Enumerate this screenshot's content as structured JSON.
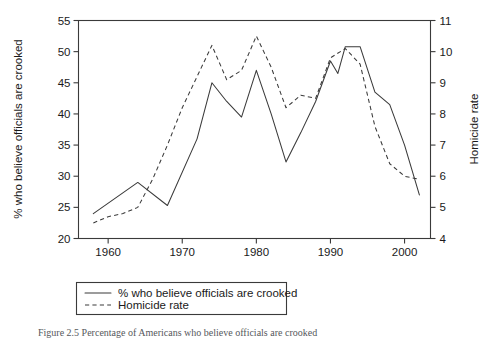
{
  "figure": {
    "caption": "Figure 2.5  Percentage of Americans who believe officials are crooked"
  },
  "chart_data": {
    "type": "line",
    "title": "",
    "xlabel": "",
    "ylabel": "% who believe officials are crooked",
    "y2label": "Homicide rate",
    "grid": false,
    "legend_position": "bottom-left",
    "xlim": [
      1956.0,
      2003.5
    ],
    "ylim": [
      20,
      55
    ],
    "y2lim": [
      4,
      11
    ],
    "xticks": [
      1960,
      1970,
      1980,
      1990,
      2000
    ],
    "xticklabels": [
      "1960",
      "1970",
      "1980",
      "1990",
      "2000"
    ],
    "yticks": [
      20,
      25,
      30,
      35,
      40,
      45,
      50,
      55
    ],
    "yticklabels": [
      "20",
      "25",
      "30",
      "35",
      "40",
      "45",
      "50",
      "55"
    ],
    "y2ticks": [
      4,
      5,
      6,
      7,
      8,
      9,
      10,
      11
    ],
    "y2ticklabels": [
      "4",
      "5",
      "6",
      "7",
      "8",
      "9",
      "10",
      "11"
    ],
    "series": [
      {
        "name": "% who believe officials are crooked",
        "style": "solid",
        "axis": "left",
        "x": [
          1958,
          1964,
          1968,
          1972,
          1974,
          1976,
          1978,
          1980,
          1982,
          1984,
          1986,
          1988,
          1990,
          1991,
          1992,
          1994,
          1996,
          1998,
          2000,
          2002
        ],
        "values": [
          24.0,
          29.0,
          25.3,
          36.0,
          45.0,
          42.0,
          39.5,
          47.0,
          40.0,
          32.3,
          37.0,
          42.0,
          48.5,
          46.5,
          50.8,
          50.8,
          43.5,
          41.5,
          35.0,
          27.0
        ]
      },
      {
        "name": "Homicide rate",
        "style": "dashed",
        "axis": "right",
        "x": [
          1958,
          1960,
          1962,
          1964,
          1966,
          1968,
          1970,
          1972,
          1974,
          1976,
          1978,
          1980,
          1982,
          1984,
          1986,
          1988,
          1990,
          1992,
          1994,
          1996,
          1998,
          2000,
          2002
        ],
        "values": [
          4.5,
          4.7,
          4.8,
          5.0,
          5.9,
          7.0,
          8.2,
          9.2,
          10.2,
          9.1,
          9.4,
          10.5,
          9.5,
          8.2,
          8.6,
          8.5,
          9.8,
          10.1,
          9.6,
          7.6,
          6.4,
          6.0,
          5.9
        ]
      }
    ],
    "legend": [
      {
        "label": "% who believe officials are crooked",
        "style": "solid"
      },
      {
        "label": "Homicide rate",
        "style": "dashed"
      }
    ]
  }
}
